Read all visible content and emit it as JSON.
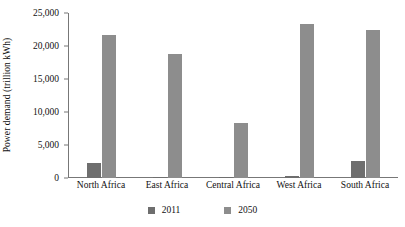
{
  "chart_data": {
    "type": "bar",
    "title": "",
    "subtitle": "",
    "xlabel": "",
    "ylabel": "Power demand (trillion kWh)",
    "categories": [
      "North Africa",
      "East Africa",
      "Central Africa",
      "West Africa",
      "South Africa"
    ],
    "series": [
      {
        "name": "2011",
        "color": "#6e6e6e",
        "values": [
          2300,
          150,
          150,
          300,
          2600
        ]
      },
      {
        "name": "2050",
        "color": "#8d8d8d",
        "values": [
          21600,
          18800,
          8400,
          23400,
          22400
        ]
      }
    ],
    "ylim": [
      0,
      25000
    ],
    "yticks": [
      0,
      5000,
      10000,
      15000,
      20000,
      25000
    ],
    "ytick_labels": [
      "0",
      "5,000",
      "10,000",
      "15,000",
      "20,000",
      "25,000"
    ],
    "grid": false,
    "legend_position": "bottom-center",
    "background": "#ffffff"
  }
}
